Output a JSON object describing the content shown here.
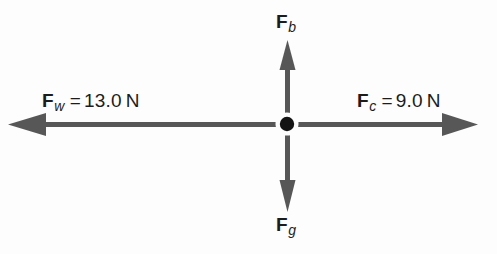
{
  "diagram": {
    "type": "free-body-force-diagram",
    "title": "",
    "background_color": "#fdfdfd",
    "arrow_color": "#575757",
    "dot_color": "#141414",
    "text_color": "#1c1c1c",
    "center_point": {
      "x": 287,
      "y": 124,
      "radius": 7
    },
    "forces": [
      {
        "id": "fw",
        "symbol": "F",
        "subscript": "w",
        "equals": "=",
        "value": "13.0",
        "unit": "N",
        "direction": "left",
        "label_text": "F_w = 13.0 N",
        "tip": {
          "x": 8,
          "y": 124
        },
        "tail": {
          "x": 287,
          "y": 124
        }
      },
      {
        "id": "fc",
        "symbol": "F",
        "subscript": "c",
        "equals": "=",
        "value": "9.0",
        "unit": "N",
        "direction": "right",
        "label_text": "F_c = 9.0 N",
        "tip": {
          "x": 478,
          "y": 124
        },
        "tail": {
          "x": 287,
          "y": 124
        }
      },
      {
        "id": "fb",
        "symbol": "F",
        "subscript": "b",
        "equals": "",
        "value": "",
        "unit": "",
        "direction": "up",
        "label_text": "F_b",
        "tip": {
          "x": 287,
          "y": 40
        },
        "tail": {
          "x": 287,
          "y": 124
        }
      },
      {
        "id": "fg",
        "symbol": "F",
        "subscript": "g",
        "equals": "",
        "value": "",
        "unit": "",
        "direction": "down",
        "label_text": "F_g",
        "tip": {
          "x": 287,
          "y": 212
        },
        "tail": {
          "x": 287,
          "y": 124
        }
      }
    ]
  }
}
